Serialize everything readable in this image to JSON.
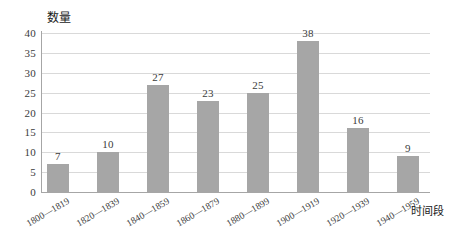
{
  "chart_data": {
    "type": "bar",
    "title": "",
    "subtitle": "",
    "xlabel": "时间段",
    "ylabel": "数量",
    "categories": [
      "1800—1819",
      "1820—1839",
      "1840—1859",
      "1860—1879",
      "1880—1899",
      "1900—1919",
      "1920—1939",
      "1940—1959"
    ],
    "values": [
      7,
      10,
      27,
      23,
      25,
      38,
      16,
      9
    ],
    "value_labels": [
      "7",
      "10",
      "27",
      "23",
      "25",
      "38",
      "16",
      "9"
    ],
    "ylim": [
      0,
      40
    ],
    "yticks": [
      0,
      5,
      10,
      15,
      20,
      25,
      30,
      35,
      40
    ],
    "ytick_labels": [
      "0",
      "5",
      "10",
      "15",
      "20",
      "25",
      "30",
      "35",
      "40"
    ],
    "grid": true,
    "grid_axis": "y",
    "legend": false,
    "bar_color": "#a6a6a6",
    "grid_color": "#d9d9d9",
    "axis_color": "#a6a6a6",
    "text_color": "#3b3b3b",
    "xtick_rotation": -30
  }
}
